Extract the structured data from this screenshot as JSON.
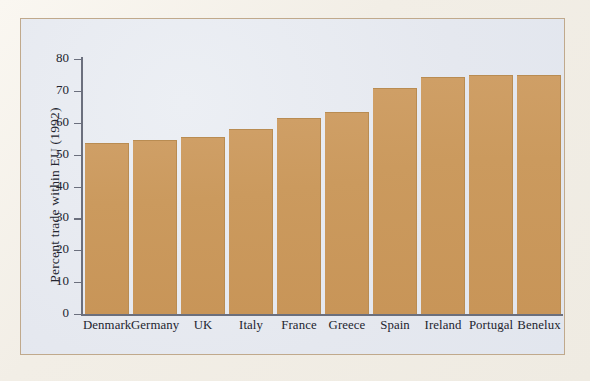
{
  "figure": {
    "background_color": "#f2eee6",
    "frame_border_color": "#c0a98c",
    "plot_background_color": "#e5e8ef",
    "bar_color": "#cb9a5e",
    "axis_color": "#6b6f7d",
    "text_color": "#23252f"
  },
  "chart_data": {
    "type": "bar",
    "title": "",
    "xlabel": "",
    "ylabel": "Percent trade within EU (1992)",
    "categories": [
      "Denmark",
      "Germany",
      "UK",
      "Italy",
      "France",
      "Greece",
      "Spain",
      "Ireland",
      "Portugal",
      "Benelux"
    ],
    "values": [
      53.5,
      54.5,
      55.5,
      58,
      61.5,
      63.5,
      71,
      74.5,
      75,
      75
    ],
    "ylim": [
      0,
      80
    ],
    "yticks": [
      0,
      10,
      20,
      30,
      40,
      50,
      60,
      70,
      80
    ],
    "ytick_labels": [
      "0",
      "10",
      "20",
      "30",
      "40",
      "50",
      "60",
      "70",
      "80"
    ],
    "grid": false,
    "legend": null,
    "legend_position": "none",
    "orientation": "vertical"
  }
}
